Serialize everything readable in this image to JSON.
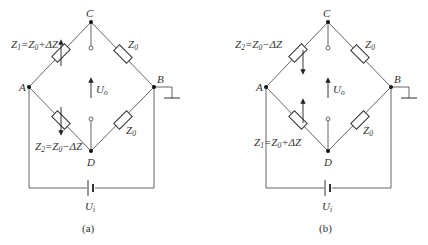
{
  "figure": {
    "panels": [
      {
        "id": "a",
        "caption": "(a)",
        "nodes": {
          "C": "C",
          "A": "A",
          "B": "B",
          "D": "D"
        },
        "z_upper_left": {
          "main": "Z",
          "sub": "1",
          "eq": "=Z",
          "sub2": "0",
          "tail": "+ΔZ"
        },
        "z_lower_left": {
          "main": "Z",
          "sub": "2",
          "eq": "=Z",
          "sub2": "0",
          "tail": "−ΔZ"
        },
        "z_upper_right": {
          "main": "Z",
          "sub": "0"
        },
        "z_lower_right": {
          "main": "Z",
          "sub": "0"
        },
        "output_voltage": {
          "main": "U",
          "sub": "o"
        },
        "input_voltage": {
          "main": "U",
          "sub": "i"
        }
      },
      {
        "id": "b",
        "caption": "(b)",
        "nodes": {
          "C": "C",
          "A": "A",
          "B": "B",
          "D": "D"
        },
        "z_upper_left": {
          "main": "Z",
          "sub": "2",
          "eq": "=Z",
          "sub2": "0",
          "tail": "−ΔZ"
        },
        "z_lower_left": {
          "main": "Z",
          "sub": "1",
          "eq": "=Z",
          "sub2": "0",
          "tail": "+ΔZ"
        },
        "z_upper_right": {
          "main": "Z",
          "sub": "0"
        },
        "z_lower_right": {
          "main": "Z",
          "sub": "0"
        },
        "output_voltage": {
          "main": "U",
          "sub": "o"
        },
        "input_voltage": {
          "main": "U",
          "sub": "i"
        }
      }
    ]
  }
}
